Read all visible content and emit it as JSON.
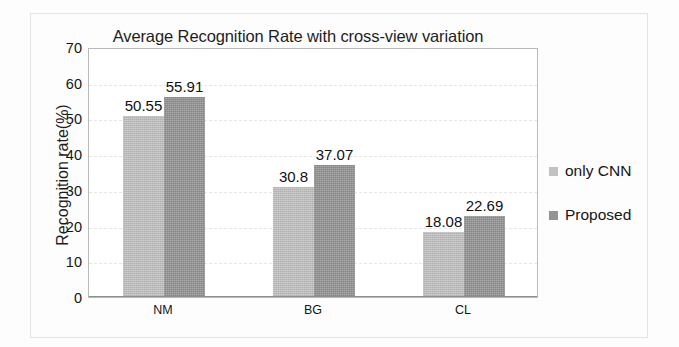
{
  "chart_data": {
    "type": "bar",
    "title": "Average Recognition Rate with cross-view variation",
    "xlabel": "",
    "ylabel": "Recognition rate(%)",
    "categories": [
      "NM",
      "BG",
      "CL"
    ],
    "ylim": [
      0,
      70
    ],
    "yticks": [
      "0",
      "10",
      "20",
      "30",
      "40",
      "50",
      "60",
      "70"
    ],
    "grid": true,
    "legend_position": "right",
    "series": [
      {
        "name": "only CNN",
        "color": "#c2c2c2",
        "values": [
          50.55,
          30.8,
          18.08
        ],
        "labels": [
          "50.55",
          "30.8",
          "18.08"
        ]
      },
      {
        "name": "Proposed",
        "color": "#949494",
        "values": [
          55.91,
          37.07,
          22.69
        ],
        "labels": [
          "55.91",
          "37.07",
          "22.69"
        ]
      }
    ]
  },
  "legend": {
    "items": [
      {
        "label": "only CNN"
      },
      {
        "label": "Proposed"
      }
    ]
  },
  "colors": {
    "series_a": "#c2c2c2",
    "series_b": "#949494",
    "axis": "#8f8f8f",
    "text": "#141414",
    "grid": "#e6e6e6",
    "frame": "#e3e3e3"
  }
}
